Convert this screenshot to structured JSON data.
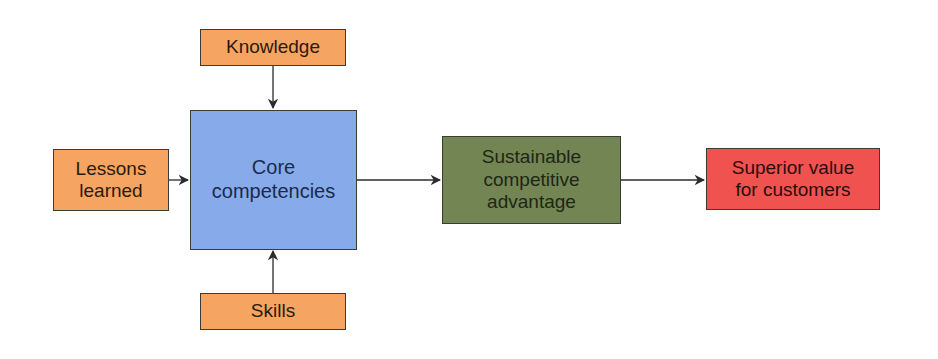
{
  "diagram": {
    "type": "flowchart",
    "nodes": {
      "knowledge": {
        "label": "Knowledge",
        "color": "#f5a561"
      },
      "lessons": {
        "label": "Lessons\nlearned",
        "color": "#f5a561"
      },
      "skills": {
        "label": "Skills",
        "color": "#f5a561"
      },
      "core": {
        "label": "Core\ncompetencies",
        "color": "#86aaea"
      },
      "advantage": {
        "label": "Sustainable\ncompetitive\nadvantage",
        "color": "#728553"
      },
      "value": {
        "label": "Superior value\nfor customers",
        "color": "#f05250"
      }
    },
    "edges": [
      {
        "from": "knowledge",
        "to": "core"
      },
      {
        "from": "lessons",
        "to": "core"
      },
      {
        "from": "skills",
        "to": "core"
      },
      {
        "from": "core",
        "to": "advantage"
      },
      {
        "from": "advantage",
        "to": "value"
      }
    ]
  }
}
